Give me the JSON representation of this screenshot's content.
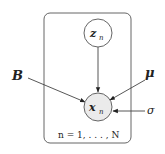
{
  "diagram": {
    "type": "graphical-model-plate",
    "plate": {
      "label": "n = 1, . . . , N",
      "x": 44,
      "y": 13,
      "width": 87,
      "height": 130,
      "rx": 6
    },
    "nodes": [
      {
        "id": "z_n",
        "label_main": "z",
        "label_sub": "n",
        "cx": 98,
        "cy": 33,
        "r": 14,
        "observed": false,
        "fill": "#ffffff"
      },
      {
        "id": "x_n",
        "label_main": "x",
        "label_sub": "n",
        "cx": 98,
        "cy": 107,
        "r": 14,
        "observed": true,
        "fill": "#ebebeb"
      }
    ],
    "parameters": [
      {
        "id": "B",
        "label": "B",
        "x": 17,
        "y": 80
      },
      {
        "id": "mu",
        "label": "μ",
        "x": 146,
        "y": 77
      },
      {
        "id": "sigma",
        "label": "σ",
        "x": 148,
        "y": 114
      }
    ],
    "edges": [
      {
        "from": "z_n",
        "to": "x_n"
      },
      {
        "from": "B",
        "to": "x_n"
      },
      {
        "from": "mu",
        "to": "x_n"
      },
      {
        "from": "sigma",
        "to": "x_n"
      }
    ],
    "colors": {
      "stroke": "#555555",
      "text": "#222222",
      "observed_fill": "#ebebeb"
    }
  }
}
